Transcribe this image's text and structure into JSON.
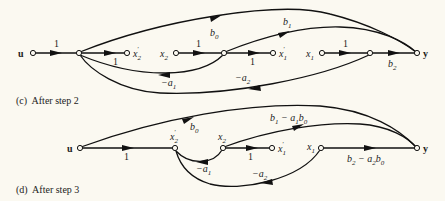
{
  "figure": {
    "panels": [
      {
        "id": "c",
        "caption": "(c)  After step 2",
        "nodes": [
          {
            "id": "u",
            "label": "u",
            "x": 33,
            "y": 53
          },
          {
            "id": "n1",
            "label": "",
            "x": 79,
            "y": 53
          },
          {
            "id": "x2p",
            "label": "x'2",
            "x": 127,
            "y": 53
          },
          {
            "id": "x2",
            "label": "x2",
            "x": 176,
            "y": 53
          },
          {
            "id": "n2",
            "label": "",
            "x": 224,
            "y": 53
          },
          {
            "id": "x1p",
            "label": "x'1",
            "x": 273,
            "y": 53
          },
          {
            "id": "x1",
            "label": "x1",
            "x": 322,
            "y": 53
          },
          {
            "id": "n3",
            "label": "",
            "x": 370,
            "y": 53
          },
          {
            "id": "y",
            "label": "y",
            "x": 417,
            "y": 53
          }
        ],
        "edges": [
          {
            "from": "u",
            "to": "n1",
            "gain": "1"
          },
          {
            "from": "n1",
            "to": "x2p",
            "gain": "1"
          },
          {
            "from": "x2",
            "to": "n2",
            "gain": "1"
          },
          {
            "from": "n2",
            "to": "x1p",
            "gain": "1"
          },
          {
            "from": "x1",
            "to": "n3",
            "gain": "1"
          },
          {
            "from": "n3",
            "to": "y",
            "gain": "b2"
          },
          {
            "from": "n1",
            "to": "y",
            "gain": "b0"
          },
          {
            "from": "n2",
            "to": "y",
            "gain": "b1"
          },
          {
            "from": "n2",
            "to": "n1",
            "gain": "-a1"
          },
          {
            "from": "n3",
            "to": "n1",
            "gain": "-a2"
          }
        ],
        "labels": {
          "u": "u",
          "x2p": "x",
          "x2p_sub": "2",
          "x2": "x",
          "x2_sub": "2",
          "x1p": "x",
          "x1p_sub": "1",
          "x1": "x",
          "x1_sub": "1",
          "y": "y",
          "g_u_n1": "1",
          "g_n1_x2p": "1",
          "g_x2_n2": "1",
          "g_n2_x1p": "1",
          "g_x1_n3": "1",
          "b0": "b",
          "b0_sub": "0",
          "b1": "b",
          "b1_sub": "1",
          "b2": "b",
          "b2_sub": "2",
          "a1": "−a",
          "a1_sub": "1",
          "a2": "−a",
          "a2_sub": "2"
        }
      },
      {
        "id": "d",
        "caption": "(d)  After step 3",
        "nodes": [
          {
            "id": "u",
            "label": "u",
            "x": 80,
            "y": 148
          },
          {
            "id": "x2p",
            "label": "x'2",
            "x": 175,
            "y": 148
          },
          {
            "id": "x2",
            "label": "x2",
            "x": 223,
            "y": 148
          },
          {
            "id": "x1p",
            "label": "x'1",
            "x": 272,
            "y": 148
          },
          {
            "id": "x1",
            "label": "x1",
            "x": 321,
            "y": 148
          },
          {
            "id": "y",
            "label": "y",
            "x": 417,
            "y": 148
          }
        ],
        "edges": [
          {
            "from": "u",
            "to": "x2p",
            "gain": "1"
          },
          {
            "from": "x2",
            "to": "x1p",
            "gain": "1"
          },
          {
            "from": "u",
            "to": "y",
            "gain": "b0"
          },
          {
            "from": "x2",
            "to": "y",
            "gain": "b1 - a1 b0"
          },
          {
            "from": "x1",
            "to": "y",
            "gain": "b2 - a2 b0"
          },
          {
            "from": "x2",
            "to": "x2p",
            "gain": "-a1"
          },
          {
            "from": "x1",
            "to": "x2p",
            "gain": "-a2"
          }
        ],
        "labels": {
          "u": "u",
          "x2p": "x",
          "x2p_sub": "2",
          "x2": "x",
          "x2_sub": "2",
          "x1p": "x",
          "x1p_sub": "1",
          "x1": "x",
          "x1_sub": "1",
          "y": "y",
          "g_u_x2p": "1",
          "g_x2_x1p": "1",
          "b0": "b",
          "b0_sub": "0",
          "b1a": "b",
          "b1a_sub": "1",
          "b1a_mid": " − a",
          "b1a_mid_sub": "1",
          "b1a_end": "b",
          "b1a_end_sub": "0",
          "b2a": "b",
          "b2a_sub": "2",
          "b2a_mid": " − a",
          "b2a_mid_sub": "2",
          "b2a_end": "b",
          "b2a_end_sub": "0",
          "a1": "−a",
          "a1_sub": "1",
          "a2": "−a",
          "a2_sub": "2"
        }
      }
    ]
  }
}
